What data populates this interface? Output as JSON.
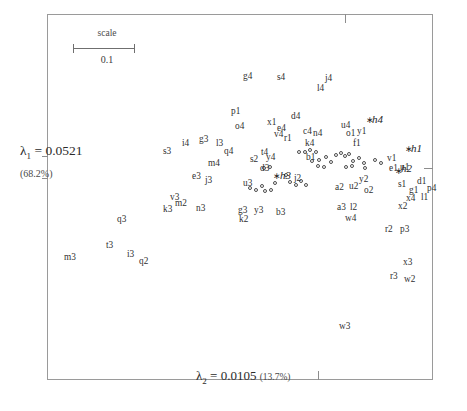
{
  "figure": {
    "type": "correspondence-analysis-biplot",
    "frame": {
      "x": 47,
      "y": 14,
      "w": 386,
      "h": 366
    },
    "scale_bar": {
      "label": "scale",
      "value": "0.1"
    },
    "axis1": {
      "symbol": "λ",
      "sub": "1",
      "eq": "=",
      "value": "0.0521",
      "pct": "(68.2%)"
    },
    "axis2": {
      "symbol": "λ",
      "sub": "2",
      "eq": "=",
      "value": "0.0105",
      "pct": "(13.7%)"
    }
  },
  "chart_data": {
    "type": "scatter",
    "title": "",
    "xlabel": "λ2 = 0.0105 (13.7%)",
    "ylabel": "λ1 = 0.0521 (68.2%)",
    "grid": false,
    "legend": null,
    "marker_style": "open-circle",
    "supplementary_marker_style": "star",
    "note": "Pixel coordinates are measured from the top-left of the 467x411 image.",
    "labels": [
      {
        "t": "g4",
        "x": 243,
        "y": 72
      },
      {
        "t": "s4",
        "x": 277,
        "y": 73
      },
      {
        "t": "j4",
        "x": 325,
        "y": 74
      },
      {
        "t": "l4",
        "x": 317,
        "y": 84
      },
      {
        "t": "p1",
        "x": 231,
        "y": 107
      },
      {
        "t": "o4",
        "x": 235,
        "y": 122
      },
      {
        "t": "x1",
        "x": 267,
        "y": 118
      },
      {
        "t": "d4",
        "x": 291,
        "y": 112
      },
      {
        "t": "e4",
        "x": 277,
        "y": 124
      },
      {
        "t": "v4",
        "x": 274,
        "y": 130
      },
      {
        "t": "r1",
        "x": 284,
        "y": 134
      },
      {
        "t": "c4",
        "x": 303,
        "y": 127
      },
      {
        "t": "n4",
        "x": 313,
        "y": 129
      },
      {
        "t": "k4",
        "x": 305,
        "y": 139
      },
      {
        "t": "u4",
        "x": 341,
        "y": 121
      },
      {
        "t": "o1",
        "x": 346,
        "y": 129
      },
      {
        "t": "y1",
        "x": 357,
        "y": 127
      },
      {
        "t": "f1",
        "x": 353,
        "y": 139
      },
      {
        "t": "s3",
        "x": 163,
        "y": 147
      },
      {
        "t": "i4",
        "x": 182,
        "y": 139
      },
      {
        "t": "g3",
        "x": 199,
        "y": 135
      },
      {
        "t": "l3",
        "x": 216,
        "y": 139
      },
      {
        "t": "q4",
        "x": 224,
        "y": 147
      },
      {
        "t": "s2",
        "x": 250,
        "y": 155
      },
      {
        "t": "t4",
        "x": 261,
        "y": 148
      },
      {
        "t": "y4",
        "x": 266,
        "y": 153
      },
      {
        "t": "m4",
        "x": 208,
        "y": 159
      },
      {
        "t": "e3",
        "x": 192,
        "y": 172
      },
      {
        "t": "j3",
        "x": 205,
        "y": 176
      },
      {
        "t": "d3",
        "x": 260,
        "y": 164
      },
      {
        "t": "j2",
        "x": 294,
        "y": 174
      },
      {
        "t": "u3",
        "x": 243,
        "y": 179
      },
      {
        "t": "b1",
        "x": 306,
        "y": 153
      },
      {
        "t": "v1",
        "x": 387,
        "y": 154
      },
      {
        "t": "e1",
        "x": 389,
        "y": 164
      },
      {
        "t": "u1",
        "x": 400,
        "y": 163
      },
      {
        "t": "a2",
        "x": 335,
        "y": 183
      },
      {
        "t": "u2",
        "x": 349,
        "y": 182
      },
      {
        "t": "y2",
        "x": 359,
        "y": 175
      },
      {
        "t": "o2",
        "x": 364,
        "y": 186
      },
      {
        "t": "s1",
        "x": 398,
        "y": 180
      },
      {
        "t": "d1",
        "x": 417,
        "y": 177
      },
      {
        "t": "g1",
        "x": 409,
        "y": 186
      },
      {
        "t": "p4",
        "x": 427,
        "y": 184
      },
      {
        "t": "x4",
        "x": 406,
        "y": 194
      },
      {
        "t": "l1",
        "x": 421,
        "y": 193
      },
      {
        "t": "x2",
        "x": 398,
        "y": 202
      },
      {
        "t": "a3",
        "x": 337,
        "y": 203
      },
      {
        "t": "l2",
        "x": 350,
        "y": 203
      },
      {
        "t": "w4",
        "x": 345,
        "y": 214
      },
      {
        "t": "r2",
        "x": 385,
        "y": 225
      },
      {
        "t": "p3",
        "x": 400,
        "y": 225
      },
      {
        "t": "x3",
        "x": 403,
        "y": 258
      },
      {
        "t": "r3",
        "x": 390,
        "y": 272
      },
      {
        "t": "w2",
        "x": 404,
        "y": 275
      },
      {
        "t": "v3",
        "x": 170,
        "y": 193
      },
      {
        "t": "m2",
        "x": 175,
        "y": 199
      },
      {
        "t": "k3",
        "x": 163,
        "y": 205
      },
      {
        "t": "n3",
        "x": 196,
        "y": 204
      },
      {
        "t": "g3b",
        "x": 238,
        "y": 206,
        "show": "g3"
      },
      {
        "t": "k2",
        "x": 239,
        "y": 215
      },
      {
        "t": "y3",
        "x": 254,
        "y": 206
      },
      {
        "t": "b3",
        "x": 276,
        "y": 208
      },
      {
        "t": "q3",
        "x": 117,
        "y": 215
      },
      {
        "t": "t3",
        "x": 106,
        "y": 241
      },
      {
        "t": "i3",
        "x": 127,
        "y": 250
      },
      {
        "t": "m3",
        "x": 64,
        "y": 253
      },
      {
        "t": "q2",
        "x": 139,
        "y": 257
      },
      {
        "t": "w3",
        "x": 339,
        "y": 322
      }
    ],
    "supplementary_labels": [
      {
        "t": "h4",
        "x": 372,
        "y": 114,
        "star_x": 366,
        "star_y": 116
      },
      {
        "t": "h1",
        "x": 411,
        "y": 143,
        "star_x": 405,
        "star_y": 145
      },
      {
        "t": "h2",
        "x": 401,
        "y": 163,
        "star_x": 395,
        "star_y": 167
      },
      {
        "t": "h3",
        "x": 280,
        "y": 170,
        "star_x": 273,
        "star_y": 172
      }
    ],
    "points": [
      {
        "x": 262,
        "y": 186
      },
      {
        "x": 275,
        "y": 183
      },
      {
        "x": 286,
        "y": 175
      },
      {
        "x": 290,
        "y": 182
      },
      {
        "x": 296,
        "y": 185
      },
      {
        "x": 301,
        "y": 181
      },
      {
        "x": 306,
        "y": 185
      },
      {
        "x": 310,
        "y": 150
      },
      {
        "x": 316,
        "y": 152
      },
      {
        "x": 299,
        "y": 152
      },
      {
        "x": 305,
        "y": 152
      },
      {
        "x": 312,
        "y": 161
      },
      {
        "x": 319,
        "y": 160
      },
      {
        "x": 326,
        "y": 157
      },
      {
        "x": 331,
        "y": 162
      },
      {
        "x": 336,
        "y": 155
      },
      {
        "x": 341,
        "y": 153
      },
      {
        "x": 345,
        "y": 156
      },
      {
        "x": 349,
        "y": 154
      },
      {
        "x": 353,
        "y": 161
      },
      {
        "x": 359,
        "y": 158
      },
      {
        "x": 364,
        "y": 163
      },
      {
        "x": 365,
        "y": 168
      },
      {
        "x": 375,
        "y": 160
      },
      {
        "x": 381,
        "y": 163
      },
      {
        "x": 250,
        "y": 188
      },
      {
        "x": 256,
        "y": 190
      },
      {
        "x": 265,
        "y": 191
      },
      {
        "x": 271,
        "y": 190
      },
      {
        "x": 264,
        "y": 168
      },
      {
        "x": 270,
        "y": 167
      },
      {
        "x": 346,
        "y": 167
      },
      {
        "x": 352,
        "y": 166
      },
      {
        "x": 318,
        "y": 166
      },
      {
        "x": 324,
        "y": 167
      }
    ]
  }
}
